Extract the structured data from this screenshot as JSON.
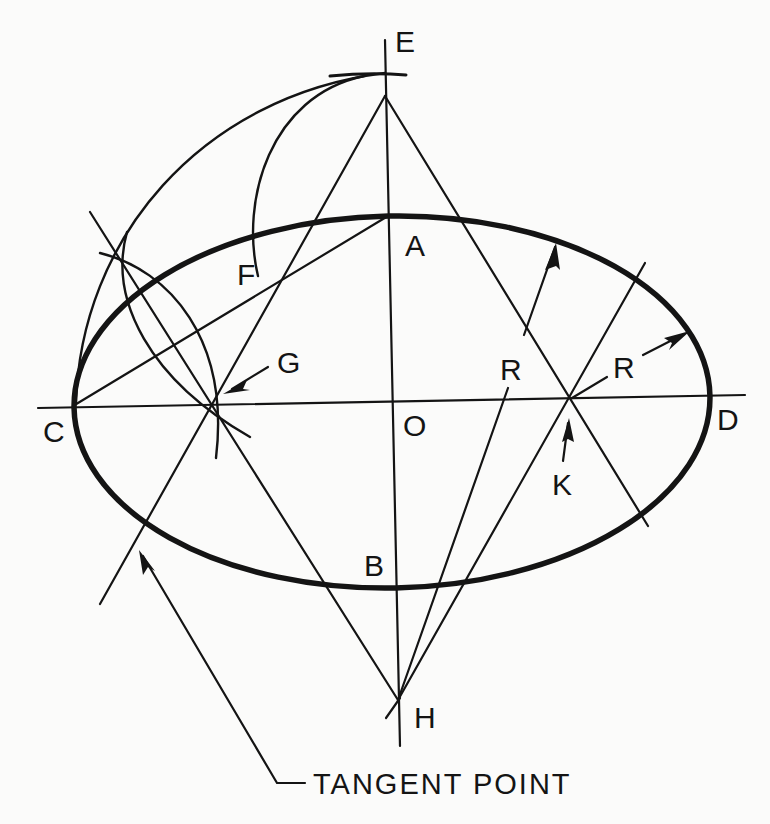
{
  "diagram": {
    "points": {
      "A": "A",
      "B": "B",
      "C": "C",
      "D": "D",
      "E": "E",
      "F": "F",
      "G": "G",
      "H": "H",
      "K": "K",
      "O": "O"
    },
    "radius_labels": [
      "R",
      "R"
    ],
    "callout": "TANGENT POINT",
    "ink_color": "#141414",
    "paper_color": "#fbfbfa"
  }
}
